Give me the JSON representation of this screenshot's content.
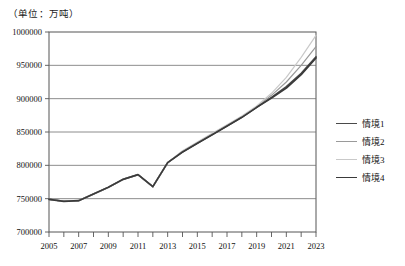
{
  "unit_note": "（单位：万吨）",
  "legend": {
    "items": [
      {
        "label": "情境1",
        "color": "#4a4a4a"
      },
      {
        "label": "情境2",
        "color": "#9a9a9a"
      },
      {
        "label": "情境3",
        "color": "#c9c9c9"
      },
      {
        "label": "情境4",
        "color": "#3a3a3a"
      }
    ]
  },
  "chart_data": {
    "type": "line",
    "title": "",
    "subtitle": "",
    "xlabel": "",
    "ylabel": "",
    "unit": "（单位：万吨）",
    "xlim": [
      2005,
      2023
    ],
    "ylim": [
      700000,
      1000000
    ],
    "ytick_values": [
      700000,
      750000,
      800000,
      850000,
      900000,
      950000,
      1000000
    ],
    "ytick_labels": [
      "700000",
      "750000",
      "800000",
      "850000",
      "900000",
      "950000",
      "1000000"
    ],
    "x": [
      2005,
      2006,
      2007,
      2008,
      2009,
      2010,
      2011,
      2012,
      2013,
      2014,
      2015,
      2016,
      2017,
      2018,
      2019,
      2020,
      2021,
      2022,
      2023
    ],
    "xtick_values": [
      2005,
      2006,
      2007,
      2008,
      2009,
      2010,
      2011,
      2012,
      2013,
      2014,
      2015,
      2016,
      2017,
      2018,
      2019,
      2020,
      2021,
      2022,
      2023
    ],
    "xtick_labels": [
      "2005",
      "",
      "2007",
      "",
      "2009",
      "",
      "2011",
      "",
      "2013",
      "",
      "2015",
      "",
      "2017",
      "",
      "2019",
      "",
      "2021",
      "",
      "2023"
    ],
    "grid": {
      "horizontal": true,
      "vertical": false
    },
    "legend_position": "right",
    "series": [
      {
        "name": "情境1",
        "color": "#4a4a4a",
        "width": 1.5,
        "values": [
          749000,
          746000,
          747000,
          757000,
          767000,
          779000,
          786000,
          768000,
          804000,
          820000,
          833000,
          846000,
          859000,
          872000,
          887000,
          902000,
          918000,
          938000,
          963000
        ]
      },
      {
        "name": "情境2",
        "color": "#9a9a9a",
        "width": 1.2,
        "values": [
          749000,
          746000,
          747000,
          757000,
          767000,
          779000,
          786000,
          768000,
          804000,
          821000,
          834000,
          847000,
          860000,
          873000,
          888000,
          905000,
          925000,
          950000,
          978000
        ]
      },
      {
        "name": "情境3",
        "color": "#c9c9c9",
        "width": 1.2,
        "values": [
          749000,
          746000,
          747000,
          757000,
          767000,
          779000,
          786000,
          768000,
          804000,
          822000,
          835000,
          848000,
          861000,
          874000,
          889000,
          908000,
          932000,
          962000,
          995000
        ]
      },
      {
        "name": "情境4",
        "color": "#3a3a3a",
        "width": 1.7,
        "values": [
          749000,
          746000,
          747000,
          757000,
          767000,
          779000,
          786000,
          768000,
          804000,
          820000,
          833000,
          846000,
          859000,
          872000,
          887000,
          901000,
          916000,
          936000,
          961000
        ]
      }
    ]
  }
}
